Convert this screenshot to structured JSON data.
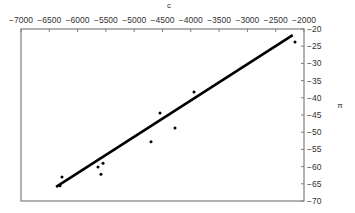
{
  "chart_data": {
    "type": "scatter",
    "title": "",
    "xlabel": "c",
    "ylabel": "π",
    "xlim": [
      -7000,
      -2000
    ],
    "ylim": [
      -70,
      -20
    ],
    "x_axis_position": "top",
    "y_axis_position": "right",
    "grid": false,
    "legend": null,
    "x_ticks": [
      -7000,
      -6500,
      -6000,
      -5500,
      -5000,
      -4500,
      -4000,
      -3500,
      -3000,
      -2500,
      -2000
    ],
    "y_ticks": [
      -20,
      -25,
      -30,
      -35,
      -40,
      -45,
      -50,
      -55,
      -60,
      -65,
      -70
    ],
    "x_tick_labels": [
      "−7000",
      "−6500",
      "−6000",
      "−5500",
      "−5000",
      "−4500",
      "−4000",
      "−3500",
      "−3000",
      "−2500",
      "−2000"
    ],
    "y_tick_labels": [
      "−20",
      "−25",
      "−30",
      "−35",
      "−40",
      "−45",
      "−50",
      "−55",
      "−60",
      "−65",
      "−70"
    ],
    "series": [
      {
        "name": "observations",
        "kind": "points",
        "color": "#000000",
        "x": [
          -6276,
          -6311,
          -5640,
          -5551,
          -5587,
          -4703,
          -4279,
          -4544,
          -3943,
          -2159
        ],
        "y": [
          -63.0,
          -65.6,
          -60.1,
          -59.0,
          -62.2,
          -52.8,
          -48.8,
          -44.4,
          -38.3,
          -23.8
        ]
      },
      {
        "name": "fit",
        "kind": "line",
        "color": "#000000",
        "x": [
          -6380,
          -2200
        ],
        "y": [
          -65.9,
          -21.8
        ]
      }
    ]
  },
  "colors": {
    "frame": "#7f7f7f",
    "text": "#333333",
    "data": "#000000"
  }
}
